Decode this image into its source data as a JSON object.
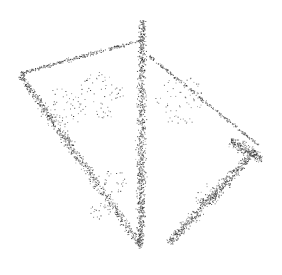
{
  "image": {
    "kind": "point-cloud-render",
    "subject": "stippled 3D object (cushion-like shape with central seam)",
    "width": 282,
    "height": 275,
    "background": "#ffffff",
    "point_color": "#2a2a2a",
    "outline": {
      "top_tip": [
        142,
        20
      ],
      "left_corner": [
        18,
        73
      ],
      "right_corner": [
        262,
        148
      ],
      "bottom": [
        140,
        250
      ],
      "bottom_right": [
        168,
        243
      ]
    },
    "bands": [
      {
        "name": "central-seam",
        "from": [
          142,
          20
        ],
        "to": [
          140,
          248
        ],
        "width": 14,
        "density": 900
      },
      {
        "name": "left-edge",
        "from": [
          20,
          75
        ],
        "to": [
          140,
          245
        ],
        "width": 14,
        "density": 700
      },
      {
        "name": "right-lower-edge",
        "from": [
          255,
          150
        ],
        "to": [
          168,
          243
        ],
        "width": 16,
        "density": 600
      },
      {
        "name": "upper-left-edge",
        "from": [
          20,
          73
        ],
        "to": [
          140,
          40
        ],
        "width": 6,
        "density": 260
      },
      {
        "name": "upper-right-edge",
        "from": [
          148,
          55
        ],
        "to": [
          258,
          145
        ],
        "width": 6,
        "density": 240
      },
      {
        "name": "right-corner-blob",
        "from": [
          230,
          140
        ],
        "to": [
          262,
          160
        ],
        "width": 18,
        "density": 220
      }
    ],
    "scatter_clusters": [
      {
        "center": [
          60,
          110
        ],
        "radius": 22,
        "count": 60
      },
      {
        "center": [
          100,
          95
        ],
        "radius": 25,
        "count": 70
      },
      {
        "center": [
          180,
          100
        ],
        "radius": 25,
        "count": 60
      },
      {
        "center": [
          205,
          195
        ],
        "radius": 12,
        "count": 25
      },
      {
        "center": [
          115,
          180
        ],
        "radius": 12,
        "count": 25
      },
      {
        "center": [
          100,
          210
        ],
        "radius": 10,
        "count": 20
      }
    ]
  }
}
